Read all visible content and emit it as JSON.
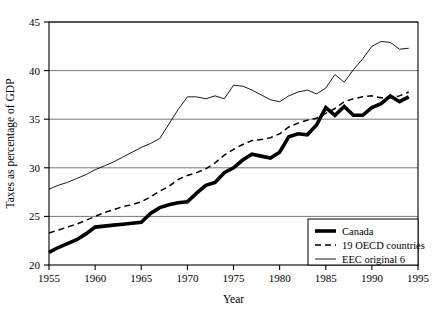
{
  "chart_data": {
    "type": "line",
    "title": "",
    "xlabel": "Year",
    "ylabel": "Taxes as percentage of GDP",
    "xlim": [
      1955,
      1995
    ],
    "ylim": [
      20,
      45
    ],
    "xticks": [
      1955,
      1960,
      1965,
      1970,
      1975,
      1980,
      1985,
      1990,
      1995
    ],
    "yticks": [
      20,
      25,
      30,
      35,
      40,
      45
    ],
    "grid": "horizontal",
    "legend_position": "bottom-right",
    "x": [
      1955,
      1956,
      1957,
      1958,
      1959,
      1960,
      1961,
      1962,
      1963,
      1964,
      1965,
      1966,
      1967,
      1968,
      1969,
      1970,
      1971,
      1972,
      1973,
      1974,
      1975,
      1976,
      1977,
      1978,
      1979,
      1980,
      1981,
      1982,
      1983,
      1984,
      1985,
      1986,
      1987,
      1988,
      1989,
      1990,
      1991,
      1992,
      1993,
      1994
    ],
    "series": [
      {
        "name": "Canada",
        "style": "thick-solid",
        "color": "#000000",
        "values": [
          21.3,
          21.8,
          22.2,
          22.6,
          23.2,
          23.9,
          24.0,
          24.1,
          24.2,
          24.3,
          24.4,
          25.3,
          25.9,
          26.2,
          26.4,
          26.5,
          27.4,
          28.2,
          28.5,
          29.5,
          30.0,
          30.8,
          31.4,
          31.2,
          31.0,
          31.6,
          33.2,
          33.5,
          33.4,
          34.4,
          36.2,
          35.4,
          36.3,
          35.4,
          35.4,
          36.2,
          36.6,
          37.4,
          36.8,
          37.3
        ]
      },
      {
        "name": "19 OECD countries",
        "style": "dashed",
        "color": "#000000",
        "values": [
          23.3,
          23.6,
          23.9,
          24.2,
          24.6,
          25.0,
          25.4,
          25.7,
          26.0,
          26.2,
          26.5,
          27.0,
          27.6,
          28.1,
          28.8,
          29.2,
          29.5,
          29.9,
          30.5,
          31.3,
          31.9,
          32.4,
          32.8,
          32.9,
          33.1,
          33.5,
          34.2,
          34.6,
          34.9,
          35.1,
          35.6,
          36.1,
          36.8,
          37.1,
          37.3,
          37.4,
          37.2,
          37.2,
          37.4,
          37.8
        ]
      },
      {
        "name": "EEC original 6",
        "style": "thin-solid",
        "color": "#000000",
        "values": [
          27.8,
          28.2,
          28.5,
          28.9,
          29.3,
          29.8,
          30.2,
          30.6,
          31.1,
          31.6,
          32.1,
          32.5,
          33.0,
          34.5,
          36.0,
          37.3,
          37.3,
          37.1,
          37.4,
          37.1,
          38.5,
          38.4,
          38.0,
          37.5,
          37.0,
          36.8,
          37.4,
          37.8,
          38.0,
          37.6,
          38.2,
          39.6,
          38.8,
          40.1,
          41.2,
          42.5,
          43.0,
          42.9,
          42.2,
          42.3
        ]
      }
    ]
  },
  "legend": {
    "items": [
      {
        "label": "Canada",
        "style": "thick-solid"
      },
      {
        "label": "19 OECD countries",
        "style": "dashed"
      },
      {
        "label": "EEC original 6",
        "style": "thin-solid"
      }
    ]
  },
  "axes": {
    "y_title": "Taxes as percentage of GDP",
    "x_title": "Year",
    "y_tick_labels": [
      "20",
      "25",
      "30",
      "35",
      "40",
      "45"
    ],
    "x_tick_labels": [
      "1955",
      "1960",
      "1965",
      "1970",
      "1975",
      "1980",
      "1985",
      "1990",
      "1995"
    ]
  }
}
